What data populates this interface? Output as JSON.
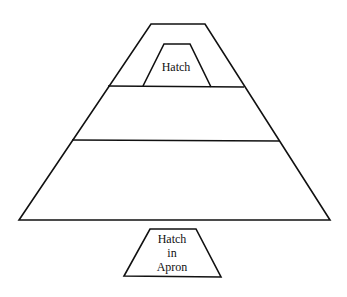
{
  "diagram": {
    "stroke_color": "#111111",
    "background": "#ffffff",
    "labels": {
      "hatch": "Hatch",
      "apron_hatch_line1": "Hatch",
      "apron_hatch_line2": "in",
      "apron_hatch_line3": "Apron"
    },
    "shapes": {
      "outer_trapezoid": {
        "top_left": [
          151,
          24
        ],
        "top_right": [
          205,
          24
        ],
        "bottom_right": [
          330,
          220
        ],
        "bottom_left": [
          19,
          220
        ]
      },
      "divider_upper": {
        "y": 86,
        "x1": 108,
        "x2": 244
      },
      "divider_lower": {
        "y": 140,
        "x1": 72,
        "x2": 280
      },
      "hatch_trapezoid": {
        "top_left": [
          164,
          44
        ],
        "top_right": [
          190,
          44
        ],
        "bottom_right": [
          211,
          87
        ],
        "bottom_left": [
          143,
          86
        ]
      },
      "apron_hatch_trapezoid": {
        "top_left": [
          150,
          229
        ],
        "top_right": [
          196,
          229
        ],
        "bottom_right": [
          221,
          277
        ],
        "bottom_left": [
          124,
          276
        ]
      }
    }
  }
}
